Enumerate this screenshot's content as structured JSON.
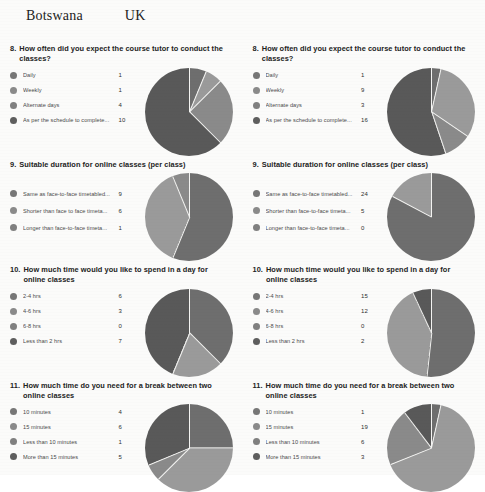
{
  "header": {
    "left_country": "Botswana",
    "right_country": "UK"
  },
  "palette": {
    "slice_colors": [
      "#6e6e6e",
      "#9a9a9a",
      "#8a8a8a",
      "#595959"
    ],
    "background": "#fbfbfa",
    "text": "#2a2a2a"
  },
  "questions": [
    {
      "number": "8.",
      "title": "How often did you expect the course tutor to conduct the classes?",
      "botswana": {
        "labels": [
          "Daily",
          "Weekly",
          "Alternate days",
          "As per the schedule to complete..."
        ],
        "values": [
          1,
          1,
          4,
          10
        ]
      },
      "uk": {
        "labels": [
          "Daily",
          "Weekly",
          "Alternate days",
          "As per the schedule to complete..."
        ],
        "values": [
          1,
          9,
          3,
          16
        ]
      }
    },
    {
      "number": "9.",
      "title": "Suitable duration for online classes (per class)",
      "botswana": {
        "labels": [
          "Same as face-to-face timetabled...",
          "Shorter than face to face timeta...",
          "Longer than face-to-face timeta..."
        ],
        "values": [
          9,
          6,
          1
        ]
      },
      "uk": {
        "labels": [
          "Same as face-to-face timetabled...",
          "Shorter than face-to-face timeta...",
          "Longer than face-to-face timeta..."
        ],
        "values": [
          24,
          5,
          0
        ]
      }
    },
    {
      "number": "10.",
      "title": "How much time would you like to spend in a day for online classes",
      "botswana": {
        "labels": [
          "2-4 hrs",
          "4-6 hrs",
          "6-8 hrs",
          "Less than 2 hrs"
        ],
        "values": [
          6,
          3,
          0,
          7
        ]
      },
      "uk": {
        "labels": [
          "2-4 hrs",
          "4-6 hrs",
          "6-8 hrs",
          "Less than 2 hrs"
        ],
        "values": [
          15,
          12,
          0,
          2
        ]
      }
    },
    {
      "number": "11.",
      "title": "How much time do you need for a break between two online classes",
      "botswana": {
        "labels": [
          "10 minutes",
          "15 minutes",
          "Less than 10 minutes",
          "More than 15 minutes"
        ],
        "values": [
          4,
          6,
          1,
          5
        ]
      },
      "uk": {
        "labels": [
          "10 minutes",
          "15 minutes",
          "Less than 10 minutes",
          "More than 15 minutes"
        ],
        "values": [
          1,
          19,
          6,
          3
        ]
      }
    }
  ],
  "chart_data": [
    {
      "type": "pie",
      "title": "8. How often did you expect the course tutor to conduct the classes? (Botswana)",
      "categories": [
        "Daily",
        "Weekly",
        "Alternate days",
        "As per the schedule to complete..."
      ],
      "values": [
        1,
        1,
        4,
        10
      ],
      "legend": "left"
    },
    {
      "type": "pie",
      "title": "8. How often did you expect the course tutor to conduct the classes? (UK)",
      "categories": [
        "Daily",
        "Weekly",
        "Alternate days",
        "As per the schedule to complete..."
      ],
      "values": [
        1,
        9,
        3,
        16
      ],
      "legend": "left"
    },
    {
      "type": "pie",
      "title": "9. Suitable duration for online classes (per class) (Botswana)",
      "categories": [
        "Same as face-to-face timetabled...",
        "Shorter than face to face timeta...",
        "Longer than face-to-face timeta..."
      ],
      "values": [
        9,
        6,
        1
      ],
      "legend": "left"
    },
    {
      "type": "pie",
      "title": "9. Suitable duration for online classes (per class) (UK)",
      "categories": [
        "Same as face-to-face timetabled...",
        "Shorter than face-to-face timeta...",
        "Longer than face-to-face timeta..."
      ],
      "values": [
        24,
        5,
        0
      ],
      "legend": "left"
    },
    {
      "type": "pie",
      "title": "10. How much time would you like to spend in a day for online classes (Botswana)",
      "categories": [
        "2-4 hrs",
        "4-6 hrs",
        "6-8 hrs",
        "Less than 2 hrs"
      ],
      "values": [
        6,
        3,
        0,
        7
      ],
      "legend": "left"
    },
    {
      "type": "pie",
      "title": "10. How much time would you like to spend in a day for online classes (UK)",
      "categories": [
        "2-4 hrs",
        "4-6 hrs",
        "6-8 hrs",
        "Less than 2 hrs"
      ],
      "values": [
        15,
        12,
        0,
        2
      ],
      "legend": "left"
    },
    {
      "type": "pie",
      "title": "11. How much time do you need for a break between two online classes (Botswana)",
      "categories": [
        "10 minutes",
        "15 minutes",
        "Less than 10 minutes",
        "More than 15 minutes"
      ],
      "values": [
        4,
        6,
        1,
        5
      ],
      "legend": "left"
    },
    {
      "type": "pie",
      "title": "11. How much time do you need for a break between two online classes (UK)",
      "categories": [
        "10 minutes",
        "15 minutes",
        "Less than 10 minutes",
        "More than 15 minutes"
      ],
      "values": [
        1,
        19,
        6,
        3
      ],
      "legend": "left"
    }
  ]
}
